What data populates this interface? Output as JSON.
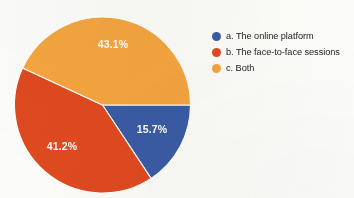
{
  "chart_data": {
    "type": "pie",
    "title": "",
    "subtitle": "",
    "xlabel": "",
    "ylabel": "",
    "grid": false,
    "legend_position": "right",
    "categories": [
      "a. The online platform",
      "b. The face-to-face sessions",
      "c. Both"
    ],
    "values": [
      15.7,
      41.2,
      43.1
    ],
    "value_unit": "%",
    "data_labels": [
      "15.7%",
      "41.2%",
      "43.1%"
    ],
    "colors": [
      "#3a5ba6",
      "#df4a20",
      "#f5a540"
    ],
    "label_color": "#ffffff",
    "start_angle_deg": 90,
    "direction": "clockwise"
  },
  "pie": {
    "slices": [
      {
        "key": "online-platform",
        "label": "a. The online platform",
        "value": 15.7,
        "data_label": "15.7%",
        "color": "#3a5ba6",
        "label_x": 152,
        "label_y": 130
      },
      {
        "key": "face-to-face-sessions",
        "label": "b. The face-to-face sessions",
        "value": 41.2,
        "data_label": "41.2%",
        "color": "#df4a20",
        "label_x": 62,
        "label_y": 147
      },
      {
        "key": "both",
        "label": "c. Both",
        "value": 43.1,
        "data_label": "43.1%",
        "color": "#f5a540",
        "label_x": 113,
        "label_y": 45
      }
    ]
  },
  "legend": {
    "items": [
      {
        "key": "online-platform",
        "label": "a. The online platform",
        "color": "#3a5ba6"
      },
      {
        "key": "face-to-face-sessions",
        "label": "b. The face-to-face sessions",
        "color": "#df4a20"
      },
      {
        "key": "both",
        "label": "c. Both",
        "color": "#f5a540"
      }
    ]
  }
}
